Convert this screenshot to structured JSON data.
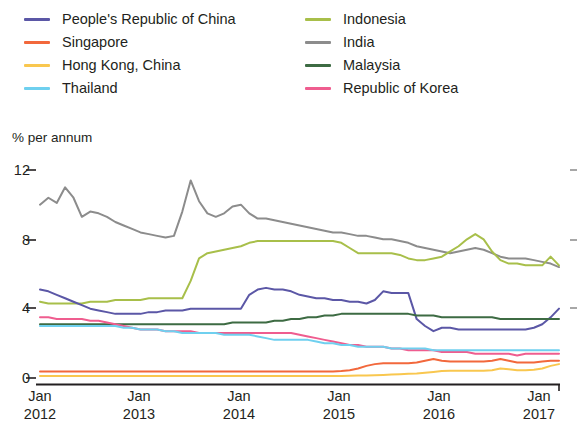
{
  "legend": {
    "columns": [
      {
        "items": [
          {
            "label": "People's Republic of China",
            "color": "#5b57a6",
            "key": "prc"
          },
          {
            "label": "Singapore",
            "color": "#f2683c",
            "key": "singapore"
          },
          {
            "label": "Hong Kong, China",
            "color": "#f9c74f",
            "key": "hongkong"
          },
          {
            "label": "Thailand",
            "color": "#6fd0ef",
            "key": "thailand"
          }
        ]
      },
      {
        "items": [
          {
            "label": "Indonesia",
            "color": "#a8bf4a",
            "key": "indonesia"
          },
          {
            "label": "India",
            "color": "#8c8c8c",
            "key": "india"
          },
          {
            "label": "Malaysia",
            "color": "#3d6b43",
            "key": "malaysia"
          },
          {
            "label": "Republic of Korea",
            "color": "#ef5d8f",
            "key": "korea"
          }
        ]
      }
    ]
  },
  "axes": {
    "ylabel": "% per annum",
    "yticks": [
      "12",
      "8",
      "4",
      "0"
    ],
    "xticks": [
      {
        "month": "Jan",
        "year": "2012"
      },
      {
        "month": "Jan",
        "year": "2013"
      },
      {
        "month": "Jan",
        "year": "2014"
      },
      {
        "month": "Jan",
        "year": "2015"
      },
      {
        "month": "Jan",
        "year": "2016"
      },
      {
        "month": "Jan",
        "year": "2017"
      }
    ]
  },
  "chart_data": {
    "type": "line",
    "title": "",
    "subtitle": "",
    "xlabel": "",
    "ylabel": "% per annum",
    "ylim": [
      0,
      12
    ],
    "yticks": [
      0,
      4,
      8,
      12
    ],
    "grid": false,
    "legend_position": "top",
    "xlim": [
      "2012-01",
      "2017-04"
    ],
    "x": [
      "2012-01",
      "2012-02",
      "2012-03",
      "2012-04",
      "2012-05",
      "2012-06",
      "2012-07",
      "2012-08",
      "2012-09",
      "2012-10",
      "2012-11",
      "2012-12",
      "2013-01",
      "2013-02",
      "2013-03",
      "2013-04",
      "2013-05",
      "2013-06",
      "2013-07",
      "2013-08",
      "2013-09",
      "2013-10",
      "2013-11",
      "2013-12",
      "2014-01",
      "2014-02",
      "2014-03",
      "2014-04",
      "2014-05",
      "2014-06",
      "2014-07",
      "2014-08",
      "2014-09",
      "2014-10",
      "2014-11",
      "2014-12",
      "2015-01",
      "2015-02",
      "2015-03",
      "2015-04",
      "2015-05",
      "2015-06",
      "2015-07",
      "2015-08",
      "2015-09",
      "2015-10",
      "2015-11",
      "2015-12",
      "2016-01",
      "2016-02",
      "2016-03",
      "2016-04",
      "2016-05",
      "2016-06",
      "2016-07",
      "2016-08",
      "2016-09",
      "2016-10",
      "2016-11",
      "2016-12",
      "2017-01",
      "2017-02",
      "2017-03"
    ],
    "series": [
      {
        "name": "India",
        "color": "#8c8c8c",
        "values": [
          10.0,
          10.4,
          10.1,
          11.0,
          10.4,
          9.3,
          9.6,
          9.5,
          9.3,
          9.0,
          8.8,
          8.6,
          8.4,
          8.3,
          8.2,
          8.1,
          8.2,
          9.6,
          11.4,
          10.2,
          9.5,
          9.3,
          9.5,
          9.9,
          10.0,
          9.5,
          9.2,
          9.2,
          9.1,
          9.0,
          8.9,
          8.8,
          8.7,
          8.6,
          8.5,
          8.4,
          8.4,
          8.3,
          8.2,
          8.2,
          8.1,
          8.0,
          8.0,
          7.9,
          7.8,
          7.6,
          7.5,
          7.4,
          7.3,
          7.2,
          7.3,
          7.4,
          7.5,
          7.4,
          7.2,
          7.0,
          6.9,
          6.9,
          6.9,
          6.8,
          6.7,
          6.6,
          6.4
        ]
      },
      {
        "name": "Indonesia",
        "color": "#a8bf4a",
        "values": [
          4.4,
          4.3,
          4.3,
          4.3,
          4.3,
          4.3,
          4.4,
          4.4,
          4.4,
          4.5,
          4.5,
          4.5,
          4.5,
          4.6,
          4.6,
          4.6,
          4.6,
          4.6,
          5.6,
          6.9,
          7.2,
          7.3,
          7.4,
          7.5,
          7.6,
          7.8,
          7.9,
          7.9,
          7.9,
          7.9,
          7.9,
          7.9,
          7.9,
          7.9,
          7.9,
          7.9,
          7.8,
          7.5,
          7.2,
          7.2,
          7.2,
          7.2,
          7.2,
          7.1,
          6.9,
          6.8,
          6.8,
          6.9,
          7.0,
          7.3,
          7.6,
          8.0,
          8.3,
          8.0,
          7.3,
          6.8,
          6.6,
          6.6,
          6.5,
          6.5,
          6.5,
          7.0,
          6.5
        ]
      },
      {
        "name": "People's Republic of China",
        "color": "#5b57a6",
        "values": [
          5.1,
          5.0,
          4.8,
          4.6,
          4.4,
          4.2,
          4.0,
          3.9,
          3.8,
          3.7,
          3.7,
          3.7,
          3.7,
          3.8,
          3.8,
          3.9,
          3.9,
          3.9,
          4.0,
          4.0,
          4.0,
          4.0,
          4.0,
          4.0,
          4.0,
          4.8,
          5.1,
          5.2,
          5.1,
          5.1,
          5.0,
          4.8,
          4.7,
          4.6,
          4.6,
          4.5,
          4.5,
          4.4,
          4.4,
          4.3,
          4.5,
          5.0,
          4.9,
          4.9,
          4.9,
          3.4,
          3.0,
          2.7,
          2.9,
          2.9,
          2.8,
          2.8,
          2.8,
          2.8,
          2.8,
          2.8,
          2.8,
          2.8,
          2.8,
          2.9,
          3.1,
          3.5,
          4.0
        ]
      },
      {
        "name": "Malaysia",
        "color": "#3d6b43",
        "values": [
          3.1,
          3.1,
          3.1,
          3.1,
          3.1,
          3.1,
          3.1,
          3.1,
          3.1,
          3.1,
          3.1,
          3.1,
          3.1,
          3.1,
          3.1,
          3.1,
          3.1,
          3.1,
          3.1,
          3.1,
          3.1,
          3.1,
          3.1,
          3.2,
          3.2,
          3.2,
          3.2,
          3.2,
          3.3,
          3.3,
          3.4,
          3.4,
          3.5,
          3.5,
          3.6,
          3.6,
          3.7,
          3.7,
          3.7,
          3.7,
          3.7,
          3.7,
          3.7,
          3.7,
          3.7,
          3.6,
          3.6,
          3.6,
          3.5,
          3.5,
          3.5,
          3.5,
          3.5,
          3.5,
          3.5,
          3.4,
          3.4,
          3.4,
          3.4,
          3.4,
          3.4,
          3.4,
          3.4
        ]
      },
      {
        "name": "Republic of Korea",
        "color": "#ef5d8f",
        "values": [
          3.5,
          3.5,
          3.4,
          3.4,
          3.4,
          3.4,
          3.3,
          3.3,
          3.2,
          3.1,
          3.0,
          2.9,
          2.8,
          2.8,
          2.8,
          2.7,
          2.7,
          2.7,
          2.7,
          2.6,
          2.6,
          2.6,
          2.6,
          2.6,
          2.6,
          2.6,
          2.6,
          2.6,
          2.6,
          2.6,
          2.6,
          2.5,
          2.4,
          2.3,
          2.2,
          2.1,
          2.0,
          1.9,
          1.9,
          1.8,
          1.8,
          1.8,
          1.7,
          1.7,
          1.6,
          1.6,
          1.6,
          1.6,
          1.5,
          1.5,
          1.5,
          1.5,
          1.4,
          1.4,
          1.4,
          1.4,
          1.4,
          1.3,
          1.4,
          1.4,
          1.4,
          1.4,
          1.4
        ]
      },
      {
        "name": "Thailand",
        "color": "#6fd0ef",
        "values": [
          3.0,
          3.0,
          3.0,
          3.0,
          3.0,
          3.0,
          3.0,
          3.0,
          3.0,
          3.0,
          2.9,
          2.9,
          2.8,
          2.8,
          2.8,
          2.7,
          2.7,
          2.6,
          2.6,
          2.6,
          2.6,
          2.6,
          2.5,
          2.5,
          2.5,
          2.5,
          2.4,
          2.3,
          2.2,
          2.2,
          2.2,
          2.2,
          2.2,
          2.1,
          2.0,
          2.0,
          1.9,
          1.9,
          1.8,
          1.8,
          1.8,
          1.8,
          1.7,
          1.7,
          1.7,
          1.7,
          1.7,
          1.6,
          1.6,
          1.6,
          1.6,
          1.6,
          1.6,
          1.6,
          1.6,
          1.6,
          1.6,
          1.6,
          1.6,
          1.6,
          1.6,
          1.6,
          1.6
        ]
      },
      {
        "name": "Singapore",
        "color": "#f2683c",
        "values": [
          0.38,
          0.38,
          0.38,
          0.38,
          0.38,
          0.38,
          0.38,
          0.38,
          0.38,
          0.38,
          0.38,
          0.38,
          0.38,
          0.38,
          0.38,
          0.38,
          0.38,
          0.38,
          0.38,
          0.38,
          0.38,
          0.38,
          0.38,
          0.38,
          0.38,
          0.38,
          0.38,
          0.38,
          0.38,
          0.38,
          0.38,
          0.38,
          0.38,
          0.38,
          0.38,
          0.38,
          0.4,
          0.45,
          0.55,
          0.7,
          0.8,
          0.85,
          0.85,
          0.85,
          0.85,
          0.9,
          1.0,
          1.1,
          1.0,
          0.95,
          0.95,
          0.95,
          0.95,
          0.95,
          1.0,
          1.1,
          1.0,
          0.9,
          0.9,
          0.9,
          0.95,
          1.0,
          1.0
        ]
      },
      {
        "name": "Hong Kong, China",
        "color": "#f9c74f",
        "values": [
          0.12,
          0.12,
          0.12,
          0.12,
          0.12,
          0.12,
          0.12,
          0.12,
          0.12,
          0.12,
          0.12,
          0.12,
          0.12,
          0.12,
          0.12,
          0.12,
          0.12,
          0.12,
          0.12,
          0.12,
          0.12,
          0.12,
          0.12,
          0.12,
          0.12,
          0.12,
          0.12,
          0.12,
          0.12,
          0.12,
          0.12,
          0.12,
          0.12,
          0.12,
          0.12,
          0.12,
          0.12,
          0.13,
          0.14,
          0.15,
          0.16,
          0.18,
          0.2,
          0.22,
          0.24,
          0.26,
          0.3,
          0.35,
          0.4,
          0.42,
          0.42,
          0.42,
          0.42,
          0.42,
          0.45,
          0.55,
          0.5,
          0.45,
          0.45,
          0.48,
          0.55,
          0.7,
          0.8
        ]
      }
    ]
  }
}
